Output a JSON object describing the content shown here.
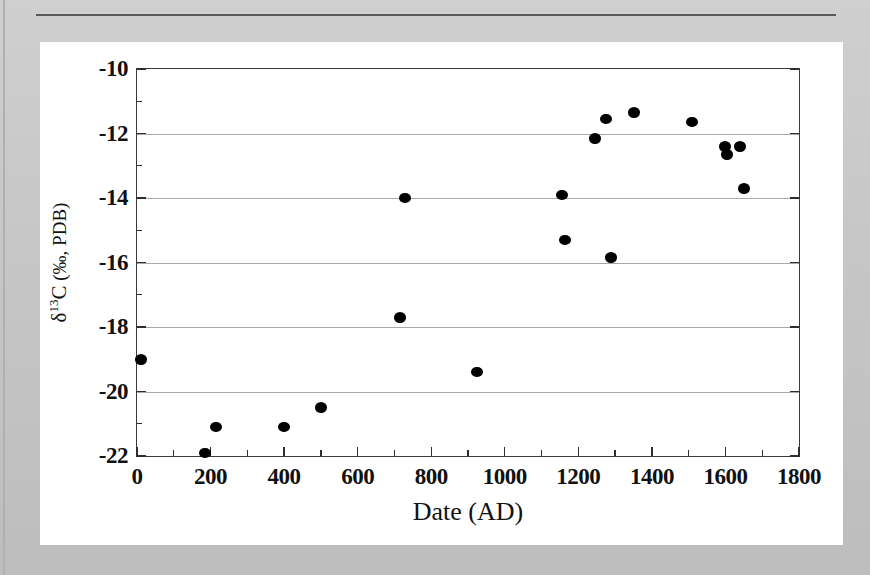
{
  "figure": {
    "background_color": "#c9c9c9",
    "card_color": "#ffffff",
    "marker_color": "#000000",
    "grid_color": "#a8a8a8",
    "axis_color": "#2e2e2e"
  },
  "chart_data": {
    "type": "scatter",
    "title": "",
    "xlabel": "Date (AD)",
    "ylabel": "δ13C (‰, PDB)",
    "ylabel_parts": {
      "delta": "δ",
      "superscript": "13",
      "element": "C",
      "units": "(‰, PDB)"
    },
    "xlim": [
      0,
      1800
    ],
    "ylim": [
      -22,
      -10
    ],
    "xticks": [
      0,
      200,
      400,
      600,
      800,
      1000,
      1200,
      1400,
      1600,
      1800
    ],
    "xtick_labels": [
      "0",
      "200",
      "400",
      "600",
      "800",
      "1000",
      "1200",
      "1400",
      "1600",
      "1800"
    ],
    "x_minor_step": 100,
    "yticks": [
      -10,
      -12,
      -14,
      -16,
      -18,
      -20,
      -22
    ],
    "ytick_labels": [
      "-10",
      "-12",
      "-14",
      "-16",
      "-18",
      "-20",
      "-22"
    ],
    "y_minor_step": 1,
    "grid": "horizontal-major",
    "legend": null,
    "series": [
      {
        "name": "δ13C measurements",
        "marker": "filled-circle",
        "points": [
          {
            "x": 10,
            "y": -19.0
          },
          {
            "x": 185,
            "y": -21.9
          },
          {
            "x": 215,
            "y": -21.1
          },
          {
            "x": 400,
            "y": -21.1
          },
          {
            "x": 500,
            "y": -20.5
          },
          {
            "x": 715,
            "y": -17.7
          },
          {
            "x": 730,
            "y": -14.0
          },
          {
            "x": 925,
            "y": -19.4
          },
          {
            "x": 1155,
            "y": -13.9
          },
          {
            "x": 1165,
            "y": -15.3
          },
          {
            "x": 1245,
            "y": -12.15
          },
          {
            "x": 1275,
            "y": -11.55
          },
          {
            "x": 1290,
            "y": -15.85
          },
          {
            "x": 1350,
            "y": -11.35
          },
          {
            "x": 1510,
            "y": -11.65
          },
          {
            "x": 1600,
            "y": -12.4
          },
          {
            "x": 1605,
            "y": -12.65
          },
          {
            "x": 1640,
            "y": -12.4
          },
          {
            "x": 1650,
            "y": -13.7
          }
        ]
      }
    ]
  }
}
